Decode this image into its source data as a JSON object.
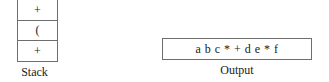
{
  "diagram": {
    "stack": {
      "caption": "Stack",
      "cells": [
        {
          "symbol": "+"
        },
        {
          "symbol": "("
        },
        {
          "symbol": "+"
        }
      ]
    },
    "output": {
      "caption": "Output",
      "text": "a b c * + d e * f"
    },
    "colors": {
      "border": "#6e6e6e",
      "text": "#1a1a1a",
      "background": "#ffffff"
    }
  }
}
